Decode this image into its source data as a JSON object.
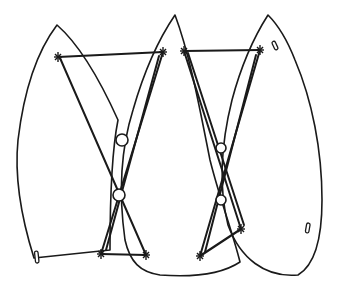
{
  "figure": {
    "type": "line-art patent-style drawing",
    "colors": {
      "line": "#1a1a1a",
      "background": "#ffffff"
    },
    "panels": [
      {
        "name": "left-panel",
        "tip": [
          57,
          25
        ],
        "has_slot": true
      },
      {
        "name": "middle-panel",
        "tip": [
          175,
          15
        ],
        "has_slot": false
      },
      {
        "name": "right-panel",
        "tip": [
          268,
          15
        ],
        "has_slot": true
      }
    ],
    "tie_bars": [
      {
        "name": "top-left-bar",
        "from": [
          58,
          57
        ],
        "to": [
          163,
          52
        ]
      },
      {
        "name": "top-right-bar",
        "from": [
          184,
          51
        ],
        "to": [
          260,
          50
        ]
      },
      {
        "name": "bottom-left-bar",
        "from": [
          101,
          254
        ],
        "to": [
          146,
          255
        ]
      },
      {
        "name": "bottom-right-bar",
        "from": [
          200,
          256
        ],
        "to": [
          241,
          229
        ]
      }
    ],
    "rings": [
      {
        "name": "upper-left-ring",
        "cx": 122,
        "cy": 140,
        "r": 6
      },
      {
        "name": "lower-left-ring",
        "cx": 119,
        "cy": 195,
        "r": 6
      },
      {
        "name": "upper-right-ring",
        "cx": 221,
        "cy": 148,
        "r": 5
      },
      {
        "name": "lower-right-ring",
        "cx": 221,
        "cy": 200,
        "r": 5
      }
    ],
    "labels": []
  }
}
